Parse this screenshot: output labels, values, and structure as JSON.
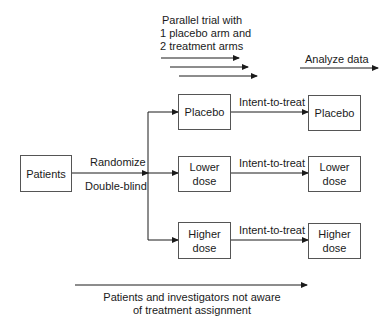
{
  "header": {
    "title_lines": [
      "Parallel trial with",
      "1 placebo arm and",
      "2 treatment arms"
    ],
    "analyze_label": "Analyze data"
  },
  "source": {
    "label": "Patients",
    "randomize_label": "Randomize",
    "blinding_label": "Double-blind"
  },
  "arms": [
    {
      "assigned": [
        "Placebo"
      ],
      "transition": "Intent-to-treat",
      "analyzed": [
        "Placebo"
      ]
    },
    {
      "assigned": [
        "Lower",
        "dose"
      ],
      "transition": "Intent-to-treat",
      "analyzed": [
        "Lower",
        "dose"
      ]
    },
    {
      "assigned": [
        "Higher",
        "dose"
      ],
      "transition": "Intent-to-treat",
      "analyzed": [
        "Higher",
        "dose"
      ]
    }
  ],
  "footer": {
    "note_lines": [
      "Patients and investigators not aware",
      "of treatment assignment"
    ]
  },
  "colors": {
    "line": "#1a1a1a",
    "box_border": "#555555",
    "text": "#1a1a1a"
  }
}
